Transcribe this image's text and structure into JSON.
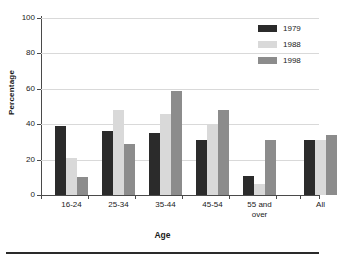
{
  "chart_data": {
    "type": "bar",
    "title": "",
    "xlabel": "Age",
    "ylabel": "Percentage",
    "ylim": [
      0,
      100
    ],
    "yticks": [
      0,
      20,
      40,
      60,
      80,
      100
    ],
    "grid": true,
    "legend_position": "top-right",
    "categories": [
      "16-24",
      "25-34",
      "35-44",
      "45-54",
      "55 and over",
      "All"
    ],
    "series": [
      {
        "name": "1979",
        "color": "#2b2b2b",
        "values": [
          39,
          36,
          35,
          31,
          11,
          31
        ]
      },
      {
        "name": "1988",
        "color": "#d9d9d9",
        "values": [
          21,
          48,
          46,
          40,
          6,
          31
        ]
      },
      {
        "name": "1998",
        "color": "#8c8c8c",
        "values": [
          10,
          29,
          59,
          48,
          31,
          34
        ]
      }
    ]
  },
  "axes": {
    "y_title": "Percentage",
    "x_title": "Age",
    "y_tick_labels": [
      "0",
      "20",
      "40",
      "60",
      "80",
      "100"
    ],
    "x_tick_labels": [
      {
        "line1": "16-24",
        "line2": ""
      },
      {
        "line1": "25-34",
        "line2": ""
      },
      {
        "line1": "35-44",
        "line2": ""
      },
      {
        "line1": "45-54",
        "line2": ""
      },
      {
        "line1": "55 and",
        "line2": "over"
      },
      {
        "line1": "All",
        "line2": ""
      }
    ]
  },
  "legend": {
    "items": [
      {
        "label": "1979",
        "color": "#2b2b2b"
      },
      {
        "label": "1988",
        "color": "#d9d9d9"
      },
      {
        "label": "1998",
        "color": "#8c8c8c"
      }
    ]
  },
  "colors": {
    "axis": "#4a4a4a",
    "gridline": "#d9d9d9",
    "text": "#1a1a1a",
    "background": "#ffffff",
    "footer_rule": "#2a2a2a"
  }
}
